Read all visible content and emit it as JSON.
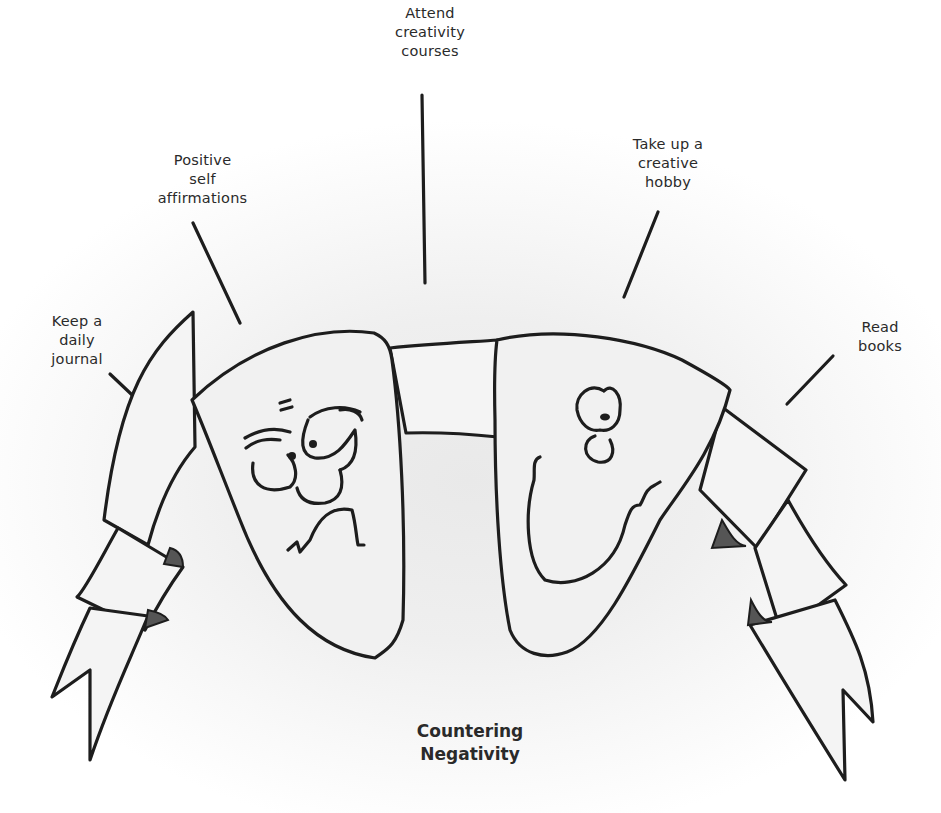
{
  "diagram": {
    "title": "Countering\nNegativity",
    "center_graphic": {
      "description": "Two shield-shaped masks joined by a ribbon banner",
      "left_mask": "frowning-face",
      "right_mask": "smiling-face"
    },
    "strategies": [
      {
        "id": "journal",
        "label": "Keep a\ndaily\njournal"
      },
      {
        "id": "affirmations",
        "label": "Positive\nself\naffirmations"
      },
      {
        "id": "courses",
        "label": "Attend\ncreativity\ncourses"
      },
      {
        "id": "hobby",
        "label": "Take up a\ncreative\nhobby"
      },
      {
        "id": "books",
        "label": "Read\nbooks"
      }
    ],
    "colors": {
      "ink": "#1d1d1d",
      "text": "#2a2a2a",
      "background": "#ffffff",
      "shading": "#e9e9e9"
    }
  }
}
